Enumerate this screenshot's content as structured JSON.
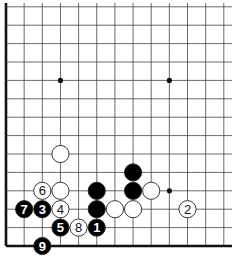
{
  "diagram": {
    "grid": {
      "origin_x": 6,
      "origin_y": 246,
      "spacing_x": 18.15,
      "spacing_y": 18.4,
      "columns": 13,
      "rows": 14,
      "line_right": 232,
      "line_top": 3,
      "edge_left": true,
      "edge_bottom": true,
      "line_color": "#444444",
      "edge_color": "#111111"
    },
    "star_points": [
      {
        "col": 3,
        "row": 9
      },
      {
        "col": 9,
        "row": 9
      },
      {
        "col": 9,
        "row": 3
      }
    ],
    "stones": [
      {
        "color": "white",
        "col": 3,
        "row": 5,
        "label": ""
      },
      {
        "color": "black",
        "col": 7,
        "row": 4,
        "label": ""
      },
      {
        "color": "white",
        "col": 2,
        "row": 3,
        "label": "6"
      },
      {
        "color": "white",
        "col": 3,
        "row": 3,
        "label": ""
      },
      {
        "color": "black",
        "col": 5,
        "row": 3,
        "label": ""
      },
      {
        "color": "black",
        "col": 7,
        "row": 3,
        "label": ""
      },
      {
        "color": "white",
        "col": 8,
        "row": 3,
        "label": ""
      },
      {
        "color": "black",
        "col": 1,
        "row": 2,
        "label": "7"
      },
      {
        "color": "black",
        "col": 2,
        "row": 2,
        "label": "3"
      },
      {
        "color": "white",
        "col": 3,
        "row": 2,
        "label": "4"
      },
      {
        "color": "black",
        "col": 5,
        "row": 2,
        "label": ""
      },
      {
        "color": "white",
        "col": 6,
        "row": 2,
        "label": ""
      },
      {
        "color": "white",
        "col": 7,
        "row": 2,
        "label": ""
      },
      {
        "color": "white",
        "col": 10,
        "row": 2,
        "label": "2"
      },
      {
        "color": "black",
        "col": 3,
        "row": 1,
        "label": "5"
      },
      {
        "color": "white",
        "col": 4,
        "row": 1,
        "label": "8"
      },
      {
        "color": "black",
        "col": 5,
        "row": 1,
        "label": "1"
      },
      {
        "color": "black",
        "col": 2,
        "row": 0,
        "label": "9"
      }
    ],
    "colors": {
      "black_stone": "#000000",
      "white_stone": "#ffffff",
      "stone_outline": "#222222"
    }
  }
}
